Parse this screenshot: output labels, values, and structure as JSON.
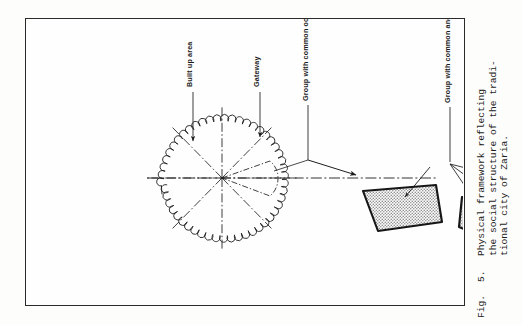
{
  "figure": {
    "caption": {
      "prefix": "Fig.",
      "number": "5.",
      "lines": [
        "Physical  framework  reflecting",
        "the social structure of the tradi-",
        "tional city  of  Zaria."
      ]
    },
    "labels": [
      {
        "id": "built-up-area",
        "text": [
          "Built up area"
        ]
      },
      {
        "id": "gateway",
        "text": [
          "Gateway"
        ]
      },
      {
        "id": "group-common-occupation",
        "text": [
          "Group with common occupation"
        ]
      },
      {
        "id": "group-common-ancestor",
        "text": [
          "Group with common ancestor"
        ]
      },
      {
        "id": "semi-public-space",
        "text": [
          "Semi- public space"
        ]
      },
      {
        "id": "marital-family-unit",
        "text": [
          "Marital family unit",
          "(sassa)"
        ]
      },
      {
        "id": "individual-hut",
        "text": [
          "Individual hut"
        ]
      },
      {
        "id": "extended-family-compound",
        "text": [
          "Extended family compound",
          "(Gida)"
        ]
      }
    ],
    "colors": {
      "ink": "#1d1d1d",
      "frame": "#2a2a2a",
      "shade_fill": "#c9c9c9",
      "paper": "#fefefe"
    }
  }
}
